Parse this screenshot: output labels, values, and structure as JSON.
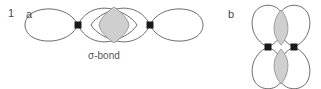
{
  "figure": {
    "item_number": "1",
    "panels": [
      {
        "label": "a",
        "caption": "σ-bond",
        "bond_type": "sigma",
        "description": "head-on overlap of two p orbitals along the internuclear axis",
        "orbital_orientation": "horizontal",
        "nuclei_count": 2,
        "overlap_lobes": 1
      },
      {
        "label": "b",
        "caption": "",
        "bond_type": "pi",
        "description": "side-on overlap of two parallel p orbitals above and below the internuclear axis",
        "orbital_orientation": "vertical",
        "nuclei_count": 2,
        "overlap_lobes": 2
      }
    ]
  },
  "colors": {
    "background": "#ffffff",
    "orbital_outline": "#5a5a5a",
    "overlap_fill": "#cfcfcf",
    "overlap_outline": "#8a8a8a",
    "nucleus_marker": "#1a1a1a",
    "label_text": "#4a4a4a",
    "caption_text": "#555555"
  },
  "geometry": {
    "panel_a": {
      "nucleus_left": {
        "x": 78,
        "y": 25
      },
      "nucleus_right": {
        "x": 150,
        "y": 25
      },
      "overlap_center": {
        "x": 114,
        "y": 25
      }
    },
    "panel_b": {
      "nucleus_left": {
        "x": 268,
        "y": 47
      },
      "nucleus_right": {
        "x": 294,
        "y": 47
      },
      "overlap_top_center": {
        "x": 281,
        "y": 26
      },
      "overlap_bottom_center": {
        "x": 281,
        "y": 68
      }
    }
  }
}
